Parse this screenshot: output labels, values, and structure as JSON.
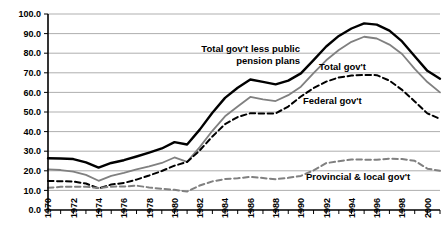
{
  "chart_data": {
    "type": "line",
    "title": "",
    "subtitle": "",
    "xlabel": "",
    "ylabel": "",
    "xlim": [
      1970,
      2001
    ],
    "ylim": [
      0.0,
      100.0
    ],
    "grid": true,
    "legend_position": "inline-annotations",
    "x": [
      1970,
      1971,
      1972,
      1973,
      1974,
      1975,
      1976,
      1977,
      1978,
      1979,
      1980,
      1981,
      1982,
      1983,
      1984,
      1985,
      1986,
      1987,
      1988,
      1989,
      1990,
      1991,
      1992,
      1993,
      1994,
      1995,
      1996,
      1997,
      1998,
      1999,
      2000,
      2001
    ],
    "xtick_labels": [
      "1970",
      "1972",
      "1974",
      "1976",
      "1978",
      "1980",
      "1982",
      "1984",
      "1986",
      "1988",
      "1990",
      "1992",
      "1994",
      "1996",
      "1998",
      "2000"
    ],
    "ytick_labels": [
      "0.0",
      "10.0",
      "20.0",
      "30.0",
      "40.0",
      "50.0",
      "60.0",
      "70.0",
      "80.0",
      "90.0",
      "100.0"
    ],
    "ytick_values": [
      0.0,
      10.0,
      20.0,
      30.0,
      40.0,
      50.0,
      60.0,
      70.0,
      80.0,
      90.0,
      100.0
    ],
    "series": [
      {
        "name": "Total gov't less public pension plans",
        "style": "solid",
        "color": "#000000",
        "width": 2.4,
        "values": [
          26.4,
          26.3,
          26.0,
          24.3,
          21.6,
          24.0,
          25.4,
          27.3,
          29.3,
          31.4,
          34.6,
          33.4,
          41.0,
          49.6,
          57.2,
          62.4,
          66.6,
          65.4,
          64.1,
          66.0,
          69.7,
          76.5,
          83.4,
          88.8,
          92.6,
          95.2,
          94.6,
          91.5,
          86.0,
          78.4,
          71.0,
          67.0
        ]
      },
      {
        "name": "Total gov't",
        "style": "solid",
        "color": "#808080",
        "width": 1.8,
        "values": [
          20.7,
          20.4,
          19.6,
          17.9,
          14.9,
          17.4,
          18.9,
          20.7,
          22.2,
          24.0,
          26.8,
          24.6,
          32.1,
          40.4,
          47.8,
          52.8,
          57.7,
          56.4,
          55.6,
          58.6,
          62.9,
          69.8,
          76.4,
          81.6,
          85.8,
          88.4,
          87.5,
          84.4,
          79.6,
          72.0,
          65.3,
          60.0
        ]
      },
      {
        "name": "Federal gov't",
        "style": "dashed",
        "color": "#000000",
        "width": 2.0,
        "values": [
          14.8,
          14.7,
          14.5,
          13.5,
          11.0,
          13.0,
          13.8,
          15.5,
          17.6,
          19.9,
          22.6,
          24.5,
          30.4,
          37.5,
          43.8,
          47.4,
          49.4,
          49.2,
          49.3,
          52.8,
          57.9,
          62.2,
          65.5,
          67.6,
          68.6,
          68.9,
          68.8,
          66.0,
          61.3,
          55.4,
          49.3,
          46.5
        ]
      },
      {
        "name": "Provincial & local gov't",
        "style": "dashed",
        "color": "#808080",
        "width": 2.0,
        "values": [
          11.3,
          11.8,
          11.9,
          11.9,
          11.2,
          11.9,
          12.0,
          12.4,
          11.5,
          10.8,
          10.3,
          9.4,
          12.5,
          14.6,
          15.8,
          16.2,
          16.9,
          16.3,
          15.7,
          16.4,
          17.4,
          20.2,
          23.9,
          24.9,
          25.8,
          25.7,
          25.6,
          26.2,
          26.0,
          25.1,
          21.1,
          20.0
        ]
      }
    ],
    "annotations": [
      {
        "id": "annot-total-less-pension",
        "text_line1": "Total gov't less public",
        "text_line2": "pension plans",
        "x": 300,
        "y": 52
      },
      {
        "id": "annot-total-gov",
        "text": "Total gov't",
        "x": 319,
        "y": 70
      },
      {
        "id": "annot-federal-gov",
        "text": "Federal gov't",
        "x": 303,
        "y": 104
      },
      {
        "id": "annot-provincial-local-gov",
        "text": "Provincial & local gov't",
        "x": 306,
        "y": 180
      }
    ]
  },
  "colors": {
    "series_black": "#000000",
    "series_gray": "#808080",
    "gridline": "#8c8c8c",
    "axis": "#000000",
    "background": "#ffffff"
  }
}
